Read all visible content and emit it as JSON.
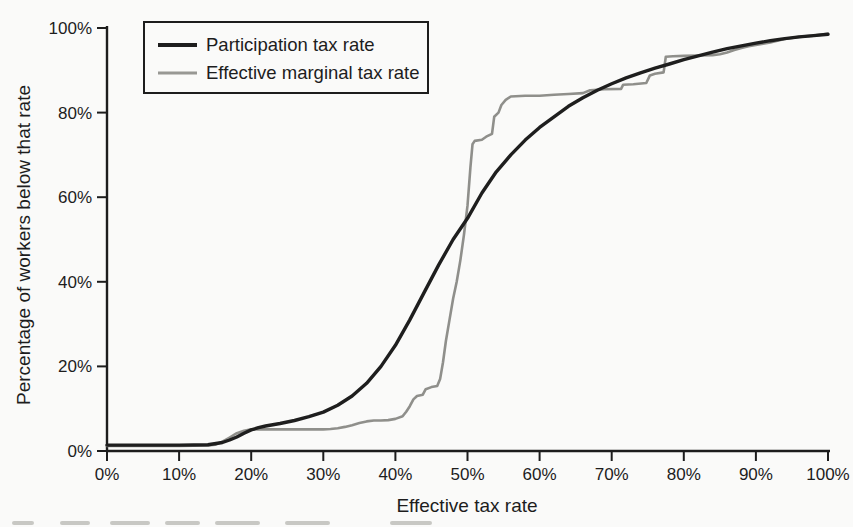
{
  "figure": {
    "background_color": "#fafaf9",
    "caption_remnant_color": "#c8c8c4"
  },
  "chart_data": {
    "type": "line",
    "title": "",
    "xlabel": "Effective tax rate",
    "ylabel": "Percentage of workers below that rate",
    "xlim": [
      0,
      100
    ],
    "ylim": [
      0,
      100
    ],
    "grid": false,
    "axis_color": "#1d1d1d",
    "x_tick_values": [
      0,
      10,
      20,
      30,
      40,
      50,
      60,
      70,
      80,
      90,
      100
    ],
    "x_tick_labels": [
      "0%",
      "10%",
      "20%",
      "30%",
      "40%",
      "50%",
      "60%",
      "70%",
      "80%",
      "90%",
      "100%"
    ],
    "y_tick_values": [
      0,
      20,
      40,
      60,
      80,
      100
    ],
    "y_tick_labels": [
      "0%",
      "20%",
      "40%",
      "60%",
      "80%",
      "100%"
    ],
    "legend": {
      "position": "top-left",
      "entries": [
        {
          "label": "Participation tax rate",
          "color": "#1e1e1e",
          "stroke_width": 4
        },
        {
          "label": "Effective marginal tax rate",
          "color": "#989894",
          "stroke_width": 3
        }
      ]
    },
    "series": [
      {
        "name": "Effective marginal tax rate",
        "color": "#8f8f8b",
        "stroke_width": 2.6,
        "points": [
          [
            0,
            1.2
          ],
          [
            5,
            1.2
          ],
          [
            10,
            1.2
          ],
          [
            14,
            1.3
          ],
          [
            15,
            1.5
          ],
          [
            16,
            2.2
          ],
          [
            17,
            3.2
          ],
          [
            18,
            4.2
          ],
          [
            19,
            4.8
          ],
          [
            20,
            5.1
          ],
          [
            22,
            5.1
          ],
          [
            24,
            5.1
          ],
          [
            26,
            5.1
          ],
          [
            28,
            5.1
          ],
          [
            30,
            5.1
          ],
          [
            31,
            5.2
          ],
          [
            32,
            5.4
          ],
          [
            33,
            5.7
          ],
          [
            34,
            6.1
          ],
          [
            35,
            6.6
          ],
          [
            36,
            7.0
          ],
          [
            37,
            7.2
          ],
          [
            38,
            7.2
          ],
          [
            39,
            7.3
          ],
          [
            40,
            7.6
          ],
          [
            41,
            8.2
          ],
          [
            41.5,
            9.3
          ],
          [
            42,
            10.6
          ],
          [
            42.5,
            12.2
          ],
          [
            43,
            13.0
          ],
          [
            43.8,
            13.3
          ],
          [
            44.2,
            14.6
          ],
          [
            45,
            15.1
          ],
          [
            45.8,
            15.4
          ],
          [
            46.2,
            17.0
          ],
          [
            46.6,
            21.0
          ],
          [
            47,
            26.0
          ],
          [
            47.5,
            31.0
          ],
          [
            48,
            36.0
          ],
          [
            48.5,
            40.0
          ],
          [
            49,
            45.0
          ],
          [
            49.5,
            51.0
          ],
          [
            50,
            58.0
          ],
          [
            50.4,
            67.0
          ],
          [
            50.7,
            72.5
          ],
          [
            51,
            73.3
          ],
          [
            52,
            73.6
          ],
          [
            52.6,
            74.3
          ],
          [
            53.4,
            75.0
          ],
          [
            53.7,
            79.0
          ],
          [
            54.3,
            80.0
          ],
          [
            54.7,
            81.8
          ],
          [
            55.3,
            83.0
          ],
          [
            56,
            83.8
          ],
          [
            58,
            84.0
          ],
          [
            60,
            84.0
          ],
          [
            62,
            84.2
          ],
          [
            64,
            84.4
          ],
          [
            66,
            84.6
          ],
          [
            67,
            85.3
          ],
          [
            69,
            85.5
          ],
          [
            71.3,
            85.6
          ],
          [
            71.6,
            86.6
          ],
          [
            73,
            86.7
          ],
          [
            74.8,
            87.0
          ],
          [
            75.3,
            88.8
          ],
          [
            76,
            89.2
          ],
          [
            77.2,
            89.5
          ],
          [
            77.5,
            93.2
          ],
          [
            78.5,
            93.3
          ],
          [
            80,
            93.4
          ],
          [
            82,
            93.5
          ],
          [
            84,
            93.6
          ],
          [
            85,
            93.8
          ],
          [
            86,
            94.2
          ],
          [
            87,
            94.8
          ],
          [
            88,
            95.3
          ],
          [
            89,
            95.7
          ],
          [
            90,
            96.0
          ],
          [
            91,
            96.3
          ],
          [
            92,
            96.6
          ],
          [
            93,
            97.0
          ],
          [
            94,
            97.4
          ],
          [
            96,
            97.9
          ],
          [
            98,
            98.2
          ],
          [
            100,
            98.6
          ]
        ]
      },
      {
        "name": "Participation tax rate",
        "color": "#1e1e1e",
        "stroke_width": 3.4,
        "points": [
          [
            0,
            1.4
          ],
          [
            5,
            1.4
          ],
          [
            10,
            1.4
          ],
          [
            14,
            1.5
          ],
          [
            16,
            2.0
          ],
          [
            17,
            2.6
          ],
          [
            18,
            3.3
          ],
          [
            19,
            4.2
          ],
          [
            20,
            5.0
          ],
          [
            21,
            5.5
          ],
          [
            22,
            5.9
          ],
          [
            24,
            6.5
          ],
          [
            26,
            7.2
          ],
          [
            28,
            8.1
          ],
          [
            30,
            9.2
          ],
          [
            32,
            10.8
          ],
          [
            34,
            13.0
          ],
          [
            36,
            16.0
          ],
          [
            38,
            20.0
          ],
          [
            40,
            25.0
          ],
          [
            42,
            31.0
          ],
          [
            44,
            37.5
          ],
          [
            46,
            44.0
          ],
          [
            48,
            50.0
          ],
          [
            50,
            55.0
          ],
          [
            52,
            61.0
          ],
          [
            54,
            66.0
          ],
          [
            56,
            70.0
          ],
          [
            58,
            73.5
          ],
          [
            60,
            76.5
          ],
          [
            62,
            79.0
          ],
          [
            64,
            81.5
          ],
          [
            66,
            83.5
          ],
          [
            68,
            85.3
          ],
          [
            70,
            86.8
          ],
          [
            72,
            88.2
          ],
          [
            74,
            89.4
          ],
          [
            76,
            90.5
          ],
          [
            78,
            91.5
          ],
          [
            80,
            92.5
          ],
          [
            82,
            93.4
          ],
          [
            84,
            94.3
          ],
          [
            86,
            95.1
          ],
          [
            88,
            95.8
          ],
          [
            90,
            96.4
          ],
          [
            92,
            97.0
          ],
          [
            94,
            97.5
          ],
          [
            96,
            97.9
          ],
          [
            98,
            98.2
          ],
          [
            100,
            98.5
          ]
        ]
      }
    ]
  }
}
